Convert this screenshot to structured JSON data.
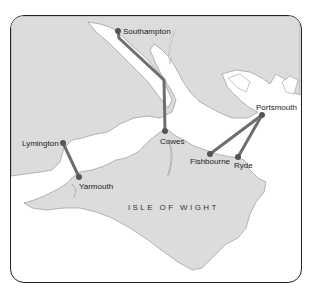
{
  "map": {
    "title": "ISLE OF WIGHT",
    "colors": {
      "land": "#dcdcdc",
      "water": "#ffffff",
      "coast": "#9a9a9a",
      "route": "#6e6e6e",
      "port": "#555555",
      "border": "#222222"
    },
    "ports": [
      {
        "name": "Southampton",
        "x": 118,
        "y": 31
      },
      {
        "name": "Cowes",
        "x": 165,
        "y": 131
      },
      {
        "name": "Portsmouth",
        "x": 262,
        "y": 115
      },
      {
        "name": "Fishbourne",
        "x": 210,
        "y": 154
      },
      {
        "name": "Ryde",
        "x": 238,
        "y": 157
      },
      {
        "name": "Lymington",
        "x": 63,
        "y": 143
      },
      {
        "name": "Yarmouth",
        "x": 79,
        "y": 177
      }
    ],
    "routes": [
      {
        "from": "Southampton",
        "to": "Cowes"
      },
      {
        "from": "Portsmouth",
        "to": "Fishbourne"
      },
      {
        "from": "Portsmouth",
        "to": "Ryde"
      },
      {
        "from": "Lymington",
        "to": "Yarmouth"
      }
    ]
  }
}
